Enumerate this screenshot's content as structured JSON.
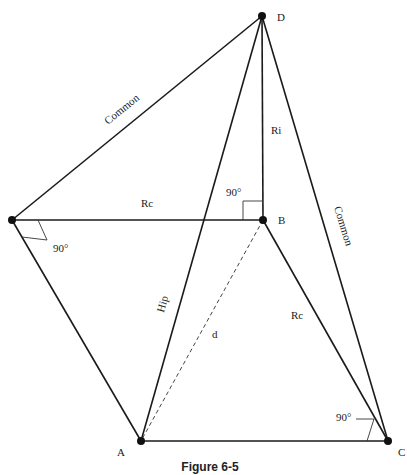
{
  "caption": "Figure 6-5",
  "points": {
    "A": {
      "label": "A",
      "x": 141,
      "y": 441
    },
    "B": {
      "label": "B",
      "x": 263,
      "y": 220
    },
    "C": {
      "label": "C",
      "x": 388,
      "y": 441
    },
    "D": {
      "label": "D",
      "x": 262,
      "y": 16
    },
    "E": {
      "label": "",
      "x": 12,
      "y": 220
    }
  },
  "edge_labels": {
    "common_left": "Common",
    "common_right": "Common",
    "ri": "Ri",
    "rc_top": "Rc",
    "rc_bottom": "Rc",
    "hip": "Hip",
    "d": "d"
  },
  "angles": {
    "at_B": "90°",
    "at_E": "90°",
    "at_C": "90°"
  },
  "colors": {
    "line": "#1a1a1a",
    "dashed": "#444444",
    "background": "#ffffff"
  }
}
